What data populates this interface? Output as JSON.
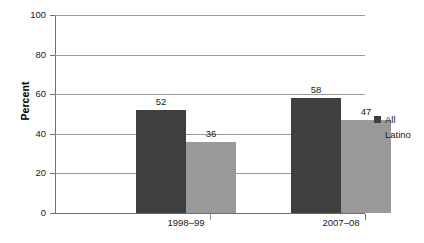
{
  "chart_data": {
    "type": "bar",
    "title": "",
    "xlabel": "",
    "ylabel": "Percent",
    "ylim": [
      0,
      100
    ],
    "ytick_step": 20,
    "yticks": [
      0,
      20,
      40,
      60,
      80,
      100
    ],
    "ytick_labels": [
      "0",
      "20",
      "40",
      "60",
      "80",
      "100"
    ],
    "categories": [
      "1998–99",
      "2007–08"
    ],
    "series": [
      {
        "name": "All",
        "values": [
          52,
          58
        ],
        "color": "#3f3f3f"
      },
      {
        "name": "Latino",
        "values": [
          36,
          47
        ],
        "color": "#999999"
      }
    ],
    "bar_labels": [
      [
        "52",
        "36"
      ],
      [
        "58",
        "47"
      ]
    ],
    "grid": true,
    "grid_axis": "y",
    "legend_position": "right",
    "legend_entries": [
      "All",
      "Latino"
    ]
  },
  "axis": {
    "y_title": "Percent"
  },
  "legend": {
    "items": [
      {
        "label": "All",
        "swatch": "dark-gray-swatch"
      },
      {
        "label": "Latino",
        "swatch": "light-gray-swatch"
      }
    ]
  },
  "colors": {
    "series_all": "#3f3f3f",
    "series_latino": "#999999",
    "gridline": "#9a9a9a",
    "axis": "#6e6e6e",
    "background": "#ffffff",
    "text": "#1a1a1a"
  }
}
